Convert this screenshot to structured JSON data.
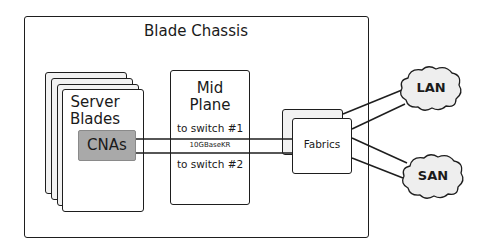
{
  "diagram": {
    "chassis": {
      "title": "Blade Chassis"
    },
    "server_blades": {
      "title_line1": "Server",
      "title_line2": "Blades",
      "nic_label": "CNAs",
      "nic_color": "#a9a9a9"
    },
    "mid_plane": {
      "title_line1": "Mid",
      "title_line2": "Plane",
      "link1": "to switch #1",
      "link_type": "10GBaseKR",
      "link2": "to switch #2"
    },
    "fabrics": {
      "label": "Fabrics"
    },
    "networks": [
      {
        "label": "LAN",
        "fill": "#eeeeee"
      },
      {
        "label": "SAN",
        "fill": "#eeeeee"
      }
    ]
  }
}
